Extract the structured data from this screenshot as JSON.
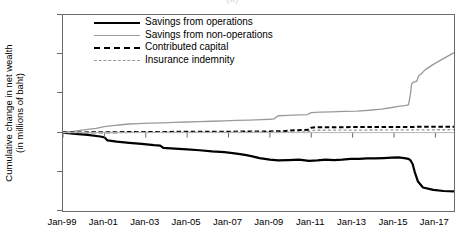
{
  "figure": {
    "caption_remnant": "(b)",
    "ylabel": "Cumulative change in net wealth\n(in millions of baht)"
  },
  "legend": {
    "position": "top-left-inside",
    "items": [
      {
        "label": "Savings from operations",
        "key": "solid-black",
        "color": "#000000"
      },
      {
        "label": "Savings from non-operations",
        "key": "solid-gray",
        "color": "#9a9a9a"
      },
      {
        "label": "Contributed capital",
        "key": "dash-black",
        "color": "#000000"
      },
      {
        "label": "Insurance indemnity",
        "key": "dash-gray",
        "color": "#9a9a9a"
      }
    ]
  },
  "axes": {
    "y_ticks": [
      "1.5",
      "1.0",
      "0.5",
      "0.0",
      "-0.5",
      "-1.0"
    ],
    "x_ticks": [
      "Jan-99",
      "Jan-01",
      "Jan-03",
      "Jan-05",
      "Jan-07",
      "Jan-09",
      "Jan-11",
      "Jan-13",
      "Jan-15",
      "Jan-17"
    ]
  },
  "chart_data": {
    "type": "line",
    "title": "",
    "subtitle": "",
    "xlabel": "",
    "ylabel": "Cumulative change in net wealth (in millions of baht)",
    "xlim": [
      1999.0,
      2017.9
    ],
    "ylim": [
      -1.0,
      1.5
    ],
    "yticks": [
      -1.0,
      -0.5,
      0.0,
      0.5,
      1.0,
      1.5
    ],
    "xticks": [
      1999,
      2001,
      2003,
      2005,
      2007,
      2009,
      2011,
      2013,
      2015,
      2017
    ],
    "xtick_labels": [
      "Jan-99",
      "Jan-01",
      "Jan-03",
      "Jan-05",
      "Jan-07",
      "Jan-09",
      "Jan-11",
      "Jan-13",
      "Jan-15",
      "Jan-17"
    ],
    "grid": false,
    "legend_position": "upper left",
    "units": "millions of baht",
    "currency": "baht",
    "series": [
      {
        "name": "Savings from operations",
        "color": "#000000",
        "style": "solid",
        "width": 2.2,
        "x": [
          1999.0,
          1999.6,
          2000.2,
          2000.8,
          2001.0,
          2001.15,
          2001.6,
          2002.2,
          2002.8,
          2003.4,
          2003.7,
          2003.85,
          2004.4,
          2005.0,
          2005.6,
          2006.2,
          2006.8,
          2007.3,
          2007.8,
          2008.1,
          2008.5,
          2009.0,
          2009.4,
          2009.9,
          2010.4,
          2010.9,
          2011.3,
          2011.7,
          2012.1,
          2012.5,
          2012.9,
          2013.3,
          2013.7,
          2014.1,
          2014.5,
          2014.9,
          2015.2,
          2015.5,
          2015.7,
          2015.8,
          2015.9,
          2016.0,
          2016.15,
          2016.4,
          2016.9,
          2017.4,
          2017.9
        ],
        "y": [
          0.0,
          -0.015,
          -0.03,
          -0.05,
          -0.06,
          -0.1,
          -0.115,
          -0.13,
          -0.145,
          -0.16,
          -0.165,
          -0.195,
          -0.205,
          -0.215,
          -0.225,
          -0.24,
          -0.25,
          -0.265,
          -0.285,
          -0.3,
          -0.325,
          -0.345,
          -0.355,
          -0.35,
          -0.345,
          -0.36,
          -0.355,
          -0.345,
          -0.35,
          -0.345,
          -0.335,
          -0.335,
          -0.33,
          -0.33,
          -0.325,
          -0.32,
          -0.315,
          -0.325,
          -0.335,
          -0.355,
          -0.4,
          -0.5,
          -0.62,
          -0.7,
          -0.73,
          -0.745,
          -0.75
        ]
      },
      {
        "name": "Savings from non-operations",
        "color": "#9a9a9a",
        "style": "solid",
        "width": 1.3,
        "x": [
          1999.0,
          1999.5,
          2000.0,
          2000.6,
          2001.0,
          2001.4,
          2001.8,
          2002.2,
          2002.6,
          2003.2,
          2003.8,
          2004.4,
          2005.0,
          2005.6,
          2006.2,
          2006.8,
          2007.4,
          2008.0,
          2008.6,
          2009.0,
          2009.2,
          2009.4,
          2009.9,
          2010.4,
          2010.8,
          2011.0,
          2011.4,
          2012.0,
          2012.6,
          2013.2,
          2013.8,
          2014.4,
          2014.9,
          2015.2,
          2015.5,
          2015.7,
          2015.8,
          2015.85,
          2015.95,
          2016.1,
          2016.2,
          2016.3,
          2016.5,
          2016.9,
          2017.3,
          2017.9
        ],
        "y": [
          0.0,
          0.015,
          0.035,
          0.055,
          0.075,
          0.09,
          0.1,
          0.11,
          0.115,
          0.12,
          0.125,
          0.13,
          0.135,
          0.14,
          0.145,
          0.15,
          0.155,
          0.16,
          0.165,
          0.17,
          0.175,
          0.215,
          0.22,
          0.225,
          0.23,
          0.255,
          0.26,
          0.265,
          0.27,
          0.275,
          0.285,
          0.3,
          0.32,
          0.335,
          0.345,
          0.355,
          0.5,
          0.62,
          0.645,
          0.655,
          0.73,
          0.745,
          0.8,
          0.87,
          0.93,
          1.02
        ]
      },
      {
        "name": "Contributed capital",
        "color": "#000000",
        "style": "dashed",
        "width": 2.0,
        "x": [
          1999.0,
          2001.0,
          2003.0,
          2005.0,
          2007.0,
          2009.0,
          2009.6,
          2010.2,
          2010.6,
          2010.9,
          2011.0,
          2011.2,
          2013.0,
          2015.0,
          2017.0,
          2017.9
        ],
        "y": [
          0.0,
          0.005,
          0.008,
          0.01,
          0.012,
          0.015,
          0.018,
          0.03,
          0.034,
          0.036,
          0.062,
          0.068,
          0.07,
          0.072,
          0.074,
          0.075
        ]
      },
      {
        "name": "Insurance indemnity",
        "color": "#9a9a9a",
        "style": "dashed",
        "width": 1.3,
        "x": [
          1999.0,
          2003.0,
          2007.0,
          2010.0,
          2010.8,
          2011.0,
          2011.3,
          2013.0,
          2015.0,
          2017.0,
          2017.9
        ],
        "y": [
          0.0,
          0.002,
          0.004,
          0.006,
          0.008,
          0.028,
          0.03,
          0.032,
          0.034,
          0.036,
          0.037
        ]
      }
    ]
  }
}
